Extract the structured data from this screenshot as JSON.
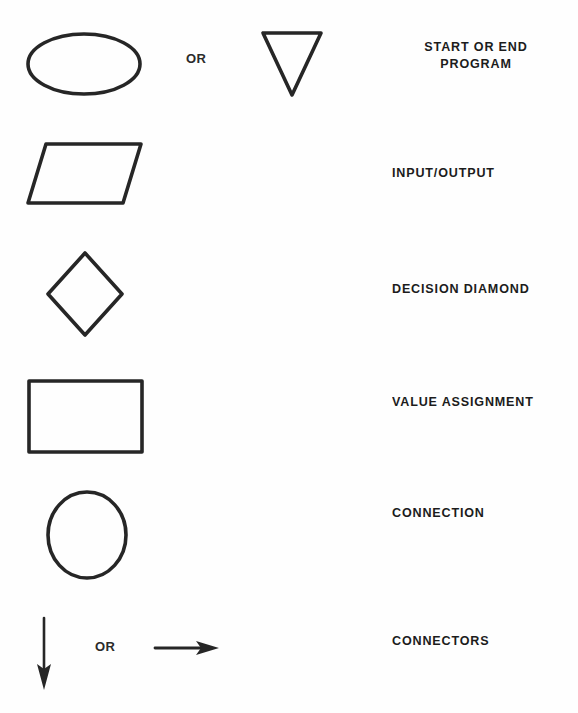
{
  "document": {
    "kind": "flowchart-symbol-legend",
    "background_color": "#fefefe",
    "ink_color": "#262626",
    "alt_separator_label": "OR"
  },
  "rows": [
    {
      "id": "start-end",
      "primary_symbol": "ellipse",
      "alt_symbol": "down-triangle",
      "alt_separator": "OR",
      "label": "START OR END\nPROGRAM",
      "label_align": "center"
    },
    {
      "id": "input-output",
      "primary_symbol": "parallelogram",
      "alt_symbol": null,
      "alt_separator": null,
      "label": "INPUT/OUTPUT",
      "label_align": "left"
    },
    {
      "id": "decision",
      "primary_symbol": "diamond",
      "alt_symbol": null,
      "alt_separator": null,
      "label": "DECISION DIAMOND",
      "label_align": "left"
    },
    {
      "id": "value-assignment",
      "primary_symbol": "rectangle",
      "alt_symbol": null,
      "alt_separator": null,
      "label": "VALUE ASSIGNMENT",
      "label_align": "left"
    },
    {
      "id": "connection",
      "primary_symbol": "circle",
      "alt_symbol": null,
      "alt_separator": null,
      "label": "CONNECTION",
      "label_align": "left"
    },
    {
      "id": "connectors",
      "primary_symbol": "down-arrow",
      "alt_symbol": "right-arrow",
      "alt_separator": "OR",
      "label": "CONNECTORS",
      "label_align": "left"
    }
  ]
}
